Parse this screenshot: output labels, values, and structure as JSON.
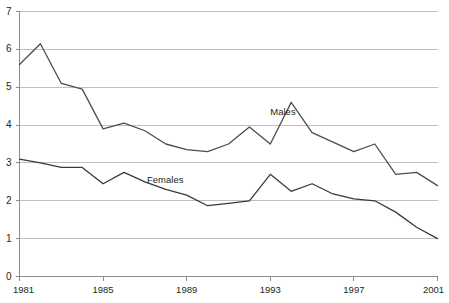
{
  "chart_data": {
    "type": "line",
    "title": "",
    "subtitle": "",
    "xlabel": "",
    "ylabel": "",
    "x": [
      1981,
      1982,
      1983,
      1984,
      1985,
      1986,
      1987,
      1988,
      1989,
      1990,
      1991,
      1992,
      1993,
      1994,
      1995,
      1996,
      1997,
      1998,
      1999,
      2000,
      2001
    ],
    "xlim": [
      1981,
      2001
    ],
    "ylim": [
      0,
      7
    ],
    "xticks": [
      1981,
      1985,
      1989,
      1993,
      1997,
      2001
    ],
    "xtick_labels": [
      "1981",
      "1985",
      "1989",
      "1993",
      "1997",
      "2001"
    ],
    "yticks": [
      0,
      1,
      2,
      3,
      4,
      5,
      6,
      7
    ],
    "ytick_labels": [
      "0",
      "1",
      "2",
      "3",
      "4",
      "5",
      "6",
      "7"
    ],
    "grid": true,
    "grid_axis": "y",
    "legend_position": "inline-annotations",
    "series": [
      {
        "name": "Males",
        "color": "#4d4d4d",
        "label_x": 1993.0,
        "label_y": 4.35,
        "values": [
          5.6,
          6.15,
          5.1,
          4.95,
          3.9,
          4.05,
          3.85,
          3.5,
          3.35,
          3.3,
          3.5,
          3.95,
          3.5,
          4.6,
          3.8,
          3.55,
          3.3,
          3.5,
          2.7,
          2.75,
          2.4
        ]
      },
      {
        "name": "Females",
        "color": "#3a3a3a",
        "label_x": 1987.1,
        "label_y": 2.55,
        "values": [
          3.1,
          3.0,
          2.88,
          2.88,
          2.45,
          2.75,
          2.5,
          2.3,
          2.15,
          1.87,
          1.93,
          2.0,
          2.7,
          2.25,
          2.45,
          2.18,
          2.05,
          2.0,
          1.7,
          1.3,
          1.0
        ]
      }
    ],
    "annotations": [
      {
        "text": "Males",
        "x": 1993.0,
        "y": 4.35
      },
      {
        "text": "Females",
        "x": 1987.1,
        "y": 2.55
      }
    ],
    "axis_color": "#8c8c8c",
    "grid_color": "#bfbfbf",
    "background": "#ffffff"
  }
}
